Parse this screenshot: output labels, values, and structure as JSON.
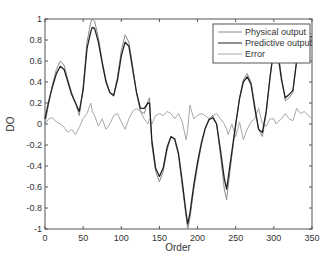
{
  "chart_data": {
    "type": "line",
    "title": "",
    "xlabel": "Order",
    "ylabel": "DO",
    "xlim": [
      0,
      350
    ],
    "ylim": [
      -1,
      1
    ],
    "xticks": [
      0,
      50,
      100,
      150,
      200,
      250,
      300,
      350
    ],
    "yticks": [
      -1,
      -0.8,
      -0.6,
      -0.4,
      -0.2,
      0,
      0.2,
      0.4,
      0.6,
      0.8,
      1
    ],
    "grid": false,
    "legend_position": "upper right",
    "x": [
      0,
      5,
      10,
      15,
      20,
      25,
      30,
      35,
      40,
      45,
      50,
      55,
      60,
      62,
      65,
      70,
      75,
      80,
      85,
      90,
      95,
      100,
      105,
      110,
      115,
      120,
      125,
      130,
      135,
      137,
      140,
      145,
      150,
      155,
      160,
      165,
      170,
      175,
      180,
      185,
      187,
      190,
      195,
      200,
      205,
      210,
      215,
      220,
      225,
      230,
      235,
      238,
      240,
      245,
      250,
      255,
      260,
      265,
      270,
      275,
      280,
      285,
      290,
      295,
      300,
      303,
      305,
      310,
      315,
      320,
      325,
      330,
      335,
      340,
      345,
      350
    ],
    "series": [
      {
        "name": "Physical output",
        "color": "#8a8a8a",
        "values": [
          0.0,
          0.2,
          0.38,
          0.52,
          0.6,
          0.56,
          0.42,
          0.3,
          0.2,
          0.08,
          0.35,
          0.78,
          0.97,
          1.0,
          0.98,
          0.82,
          0.6,
          0.42,
          0.3,
          0.28,
          0.45,
          0.7,
          0.85,
          0.78,
          0.55,
          0.3,
          0.12,
          0.1,
          0.22,
          0.25,
          -0.2,
          -0.45,
          -0.55,
          -0.45,
          -0.25,
          -0.12,
          -0.15,
          -0.3,
          -0.6,
          -0.88,
          -1.0,
          -0.9,
          -0.62,
          -0.4,
          -0.2,
          -0.05,
          0.05,
          0.08,
          0.0,
          -0.3,
          -0.62,
          -0.72,
          -0.6,
          -0.3,
          -0.02,
          0.25,
          0.42,
          0.48,
          0.4,
          0.18,
          -0.05,
          -0.12,
          0.1,
          0.45,
          0.75,
          0.82,
          0.72,
          0.45,
          0.22,
          0.25,
          0.3,
          0.62,
          0.82,
          0.86,
          0.86,
          0.86
        ]
      },
      {
        "name": "Predictive output",
        "color": "#222222",
        "values": [
          0.05,
          0.22,
          0.36,
          0.48,
          0.55,
          0.52,
          0.4,
          0.28,
          0.2,
          0.12,
          0.32,
          0.72,
          0.88,
          0.92,
          0.91,
          0.78,
          0.58,
          0.4,
          0.3,
          0.27,
          0.42,
          0.65,
          0.78,
          0.74,
          0.52,
          0.3,
          0.15,
          0.15,
          0.2,
          0.2,
          -0.15,
          -0.42,
          -0.5,
          -0.42,
          -0.22,
          -0.12,
          -0.14,
          -0.28,
          -0.55,
          -0.85,
          -0.95,
          -0.85,
          -0.58,
          -0.36,
          -0.18,
          -0.04,
          0.04,
          0.06,
          0.0,
          -0.25,
          -0.52,
          -0.62,
          -0.52,
          -0.26,
          0.0,
          0.24,
          0.4,
          0.45,
          0.38,
          0.15,
          -0.05,
          -0.08,
          0.12,
          0.44,
          0.72,
          0.78,
          0.68,
          0.42,
          0.25,
          0.28,
          0.32,
          0.6,
          0.78,
          0.82,
          0.83,
          0.83
        ]
      },
      {
        "name": "Error",
        "color": "#a8a8a8",
        "values": [
          0.0,
          0.05,
          0.06,
          0.02,
          0.0,
          -0.03,
          -0.08,
          -0.05,
          -0.1,
          -0.03,
          0.05,
          0.1,
          0.2,
          0.12,
          0.08,
          -0.02,
          0.05,
          -0.05,
          0.0,
          0.08,
          0.1,
          0.02,
          -0.05,
          0.05,
          0.12,
          0.15,
          0.12,
          0.05,
          0.0,
          0.05,
          0.0,
          0.08,
          0.1,
          0.08,
          0.12,
          0.1,
          0.05,
          0.1,
          0.02,
          -0.15,
          -0.05,
          0.18,
          0.05,
          0.08,
          0.1,
          0.08,
          0.05,
          0.08,
          0.1,
          0.05,
          0.0,
          -0.05,
          -0.1,
          0.0,
          -0.12,
          0.02,
          -0.15,
          -0.05,
          0.02,
          0.05,
          0.15,
          0.0,
          -0.02,
          0.05,
          0.05,
          0.0,
          0.02,
          0.05,
          0.1,
          0.05,
          0.03,
          0.15,
          0.1,
          0.12,
          0.08,
          0.05
        ]
      }
    ]
  },
  "legend": {
    "items": [
      {
        "label": "Physical output",
        "color": "#8a8a8a"
      },
      {
        "label": "Predictive output",
        "color": "#222222"
      },
      {
        "label": "Error",
        "color": "#a8a8a8"
      }
    ]
  },
  "axes": {
    "xlabel": "Order",
    "ylabel": "DO",
    "xtick_labels": [
      "0",
      "50",
      "100",
      "150",
      "200",
      "250",
      "300",
      "350"
    ],
    "ytick_labels": [
      "-1",
      "-0.8",
      "-0.6",
      "-0.4",
      "-0.2",
      "0",
      "0.2",
      "0.4",
      "0.6",
      "0.8",
      "1"
    ]
  }
}
